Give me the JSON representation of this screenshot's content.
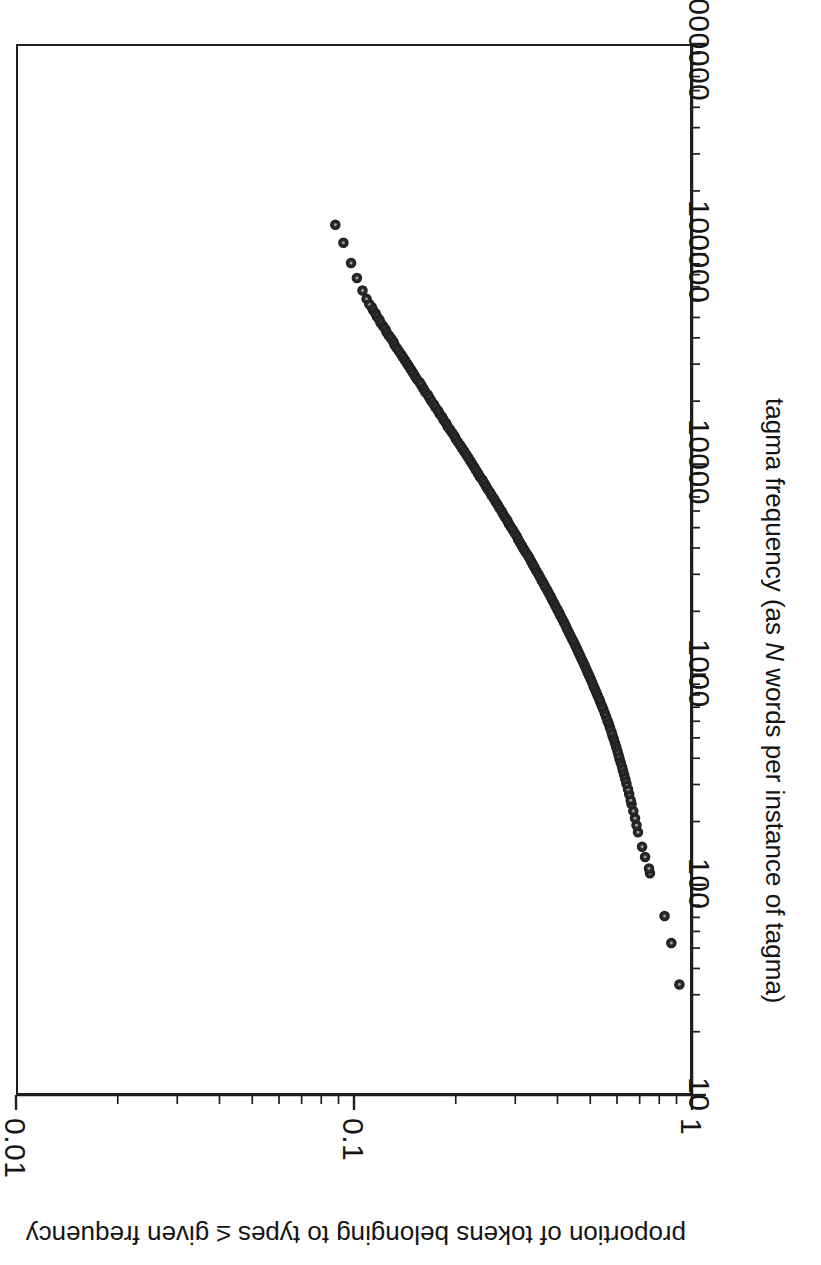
{
  "figure": {
    "orientation": "rotated-90-ccw",
    "background": "#ffffff",
    "ink_color": "#1f1f1f"
  },
  "axes": {
    "x": {
      "title_prefix": "tagma frequency (as ",
      "title_italic": "N",
      "title_suffix": " words per instance of tagma)",
      "title_full": "tagma frequency (as N words per instance of tagma)",
      "scale": "log",
      "min": 10,
      "max": 1000000,
      "tick_labels": [
        "10",
        "100",
        "1000",
        "10000",
        "100000",
        "1000000"
      ],
      "tick_values": [
        10,
        100,
        1000,
        10000,
        100000,
        1000000
      ],
      "minor_ticks": true
    },
    "y": {
      "title": "proportion of tokens belonging to types ≤ given frequency",
      "scale": "log",
      "min": 0.01,
      "max": 1,
      "tick_labels": [
        "0.01",
        "0.1",
        "1"
      ],
      "tick_values": [
        0.01,
        0.1,
        1
      ],
      "minor_ticks": true
    }
  },
  "chart_data": {
    "type": "scatter",
    "title": "",
    "xlabel": "tagma frequency (as N words per instance of tagma)",
    "ylabel": "proportion of tokens belonging to types ≤ given frequency",
    "xscale": "log",
    "yscale": "log",
    "xlim": [
      10,
      1000000
    ],
    "ylim": [
      0.01,
      1
    ],
    "grid": false,
    "legend": false,
    "marker": "open-circle",
    "marker_color": "#1f1f1f",
    "marker_size_px": 9,
    "series": [
      {
        "name": "tagma cumulative frequency",
        "x": [
          33,
          52,
          70,
          112,
          118,
          134,
          150,
          176,
          190,
          205,
          222,
          240,
          250,
          268,
          282,
          300,
          315,
          330,
          345,
          360,
          378,
          395,
          410,
          430,
          450,
          470,
          490,
          510,
          530,
          555,
          580,
          600,
          625,
          650,
          680,
          705,
          735,
          760,
          790,
          820,
          850,
          880,
          915,
          950,
          985,
          1020,
          1060,
          1100,
          1140,
          1180,
          1225,
          1270,
          1320,
          1370,
          1420,
          1470,
          1525,
          1580,
          1640,
          1700,
          1765,
          1830,
          1895,
          1965,
          2035,
          2110,
          2185,
          2265,
          2350,
          2435,
          2520,
          2610,
          2705,
          2800,
          2900,
          3000,
          3110,
          3220,
          3335,
          3450,
          3575,
          3700,
          3830,
          3965,
          4105,
          4250,
          4400,
          4555,
          4715,
          4880,
          5050,
          5230,
          5415,
          5605,
          5800,
          6005,
          6215,
          6435,
          6660,
          6895,
          7135,
          7385,
          7645,
          7915,
          8190,
          8480,
          8775,
          9085,
          9405,
          9735,
          10075,
          10430,
          10795,
          11175,
          11570,
          11975,
          12395,
          12830,
          13280,
          13745,
          14230,
          14730,
          15245,
          15780,
          16335,
          16905,
          17500,
          18115,
          18750,
          19410,
          20090,
          20795,
          21525,
          22280,
          23065,
          23875,
          24715,
          25585,
          26480,
          27410,
          28375,
          29370,
          30400,
          31470,
          32575,
          33720,
          34900,
          36130,
          37400,
          38710,
          40070,
          41480,
          42940,
          44450,
          46010,
          47630,
          49300,
          51030,
          52830,
          54690,
          56610,
          58600,
          62000,
          68000,
          78000,
          92000,
          115000,
          140000
        ],
        "y": [
          0.93,
          0.88,
          0.84,
          0.76,
          0.755,
          0.735,
          0.72,
          0.7,
          0.693,
          0.686,
          0.678,
          0.67,
          0.666,
          0.659,
          0.654,
          0.647,
          0.642,
          0.637,
          0.632,
          0.628,
          0.622,
          0.617,
          0.613,
          0.608,
          0.603,
          0.598,
          0.593,
          0.588,
          0.584,
          0.578,
          0.573,
          0.568,
          0.563,
          0.558,
          0.552,
          0.547,
          0.541,
          0.537,
          0.531,
          0.526,
          0.521,
          0.516,
          0.511,
          0.506,
          0.501,
          0.496,
          0.491,
          0.486,
          0.481,
          0.476,
          0.471,
          0.466,
          0.461,
          0.456,
          0.451,
          0.446,
          0.441,
          0.436,
          0.431,
          0.427,
          0.422,
          0.417,
          0.412,
          0.408,
          0.403,
          0.398,
          0.394,
          0.389,
          0.385,
          0.38,
          0.376,
          0.371,
          0.367,
          0.362,
          0.358,
          0.354,
          0.349,
          0.345,
          0.341,
          0.337,
          0.333,
          0.329,
          0.324,
          0.32,
          0.316,
          0.312,
          0.308,
          0.305,
          0.301,
          0.297,
          0.293,
          0.289,
          0.286,
          0.282,
          0.278,
          0.275,
          0.271,
          0.268,
          0.264,
          0.261,
          0.257,
          0.254,
          0.25,
          0.247,
          0.244,
          0.241,
          0.237,
          0.234,
          0.231,
          0.228,
          0.225,
          0.222,
          0.219,
          0.216,
          0.213,
          0.21,
          0.207,
          0.204,
          0.201,
          0.199,
          0.196,
          0.193,
          0.19,
          0.188,
          0.185,
          0.183,
          0.18,
          0.178,
          0.175,
          0.173,
          0.17,
          0.168,
          0.166,
          0.163,
          0.161,
          0.159,
          0.157,
          0.154,
          0.152,
          0.15,
          0.148,
          0.146,
          0.144,
          0.142,
          0.14,
          0.138,
          0.136,
          0.134,
          0.132,
          0.131,
          0.129,
          0.127,
          0.125,
          0.124,
          0.122,
          0.12,
          0.119,
          0.117,
          0.116,
          0.114,
          0.113,
          0.111,
          0.109,
          0.106,
          0.102,
          0.098,
          0.093,
          0.088
        ]
      }
    ]
  }
}
